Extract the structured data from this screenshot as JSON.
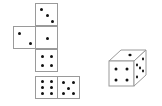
{
  "diagram": {
    "type": "cube-net-puzzle",
    "net": {
      "faces": [
        {
          "position": "top",
          "pips": 3
        },
        {
          "position": "left",
          "pips": 2
        },
        {
          "position": "center",
          "pips": 1
        },
        {
          "position": "below-center",
          "pips": 4
        },
        {
          "position": "bottom",
          "pips": 6
        },
        {
          "position": "bottom-right",
          "pips": 5
        }
      ]
    },
    "cube": {
      "front": 4,
      "top": 1,
      "right": 5
    },
    "colors": {
      "line": "#9a9a9a",
      "pip": "#111111",
      "background": "#ffffff"
    }
  }
}
